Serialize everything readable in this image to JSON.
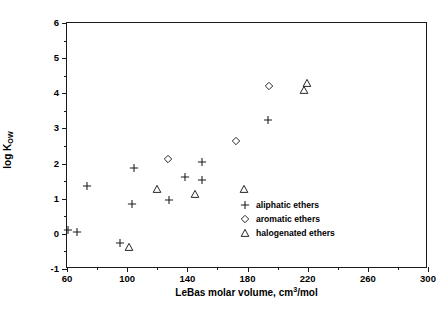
{
  "chart_data": {
    "type": "scatter",
    "title": "",
    "xlabel": "LeBas molar volume, cm3/mol",
    "xlabel_prefix": "LeBas molar volume, cm",
    "xlabel_sup": "3",
    "xlabel_suffix": "/mol",
    "ylabel": "log Kow",
    "ylabel_prefix": "log K",
    "ylabel_sub": "OW",
    "xlim": [
      60,
      300
    ],
    "ylim": [
      -1,
      6
    ],
    "xticks": [
      60,
      100,
      140,
      180,
      220,
      260,
      300
    ],
    "xticks_minor": [
      80,
      120,
      160,
      200,
      240,
      280
    ],
    "yticks": [
      -1,
      0,
      1,
      2,
      3,
      4,
      5,
      6
    ],
    "yticks_minor": [
      -0.5,
      0.5,
      1.5,
      2.5,
      3.5,
      4.5,
      5.5
    ],
    "grid": false,
    "legend_position": "lower right",
    "marker_color": "#1a1a1a",
    "series": [
      {
        "name": "aliphatic ethers",
        "marker": "plus",
        "points": [
          [
            60.5,
            0.1
          ],
          [
            66.5,
            0.05
          ],
          [
            73.0,
            1.35
          ],
          [
            95.0,
            -0.26
          ],
          [
            103.0,
            0.86
          ],
          [
            104.5,
            1.87
          ],
          [
            127.5,
            0.95
          ],
          [
            138.5,
            1.63
          ],
          [
            149.5,
            1.53
          ],
          [
            150.0,
            2.05
          ],
          [
            193.5,
            3.23
          ]
        ]
      },
      {
        "name": "aromatic ethers",
        "marker": "diamond",
        "points": [
          [
            127.0,
            2.12
          ],
          [
            172.5,
            2.65
          ],
          [
            194.0,
            4.22
          ]
        ]
      },
      {
        "name": "halogenated ethers",
        "marker": "triangle",
        "points": [
          [
            101.5,
            -0.37
          ],
          [
            120.0,
            1.28
          ],
          [
            145.0,
            1.12
          ],
          [
            178.0,
            1.27
          ],
          [
            217.5,
            4.08
          ],
          [
            219.5,
            4.3
          ]
        ]
      }
    ]
  },
  "legend": {
    "items": [
      {
        "label": "aliphatic ethers",
        "marker": "plus"
      },
      {
        "label": "aromatic ethers",
        "marker": "diamond"
      },
      {
        "label": "halogenated ethers",
        "marker": "triangle"
      }
    ]
  }
}
